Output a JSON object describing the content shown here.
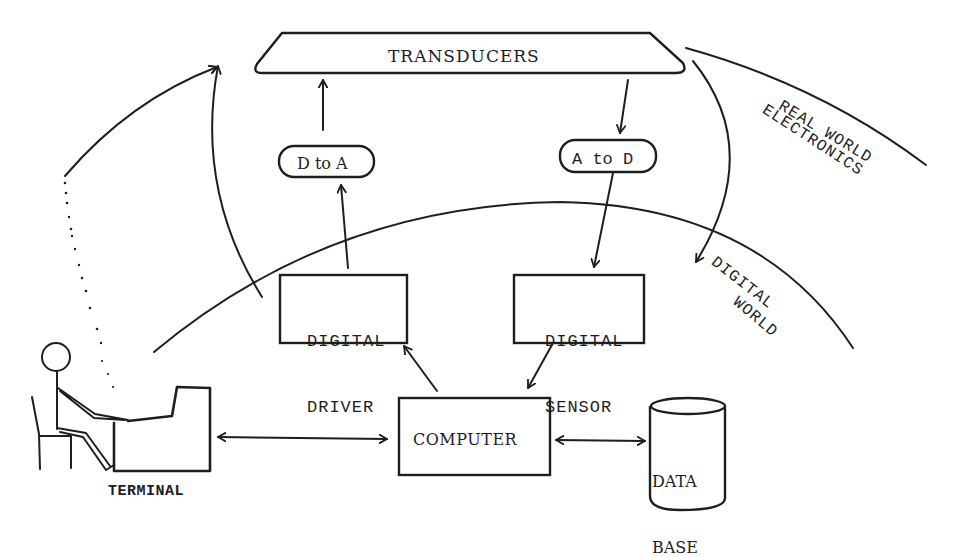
{
  "diagram": {
    "type": "system-block-diagram",
    "style": "hand-drawn typewriter illustration",
    "ink_color": "#1e1e1e",
    "background_color": "#ffffff",
    "regions": {
      "real_world_electronics": {
        "line1": "REAL WORLD",
        "line2": "ELECTRONICS"
      },
      "digital_world": {
        "line1": "DIGITAL",
        "line2": "WORLD"
      }
    },
    "nodes": {
      "transducers": {
        "label": "TRANSDUCERS",
        "shape": "rounded-trapezoid"
      },
      "d_to_a": {
        "label": "D to A",
        "shape": "pill"
      },
      "a_to_d": {
        "label": "A to D",
        "shape": "pill"
      },
      "digital_driver": {
        "line1": "DIGITAL",
        "line2": "DRIVER",
        "shape": "rectangle"
      },
      "digital_sensor": {
        "line1": "DIGITAL",
        "line2": "SENSOR",
        "shape": "rectangle"
      },
      "computer": {
        "label": "COMPUTER",
        "shape": "rectangle"
      },
      "database": {
        "line1": "DATA",
        "line2": "BASE",
        "shape": "cylinder"
      },
      "terminal": {
        "label": "TERMINAL",
        "shape": "operator-at-terminal"
      }
    },
    "edges": [
      {
        "from": "computer",
        "to": "digital_driver",
        "direction": "forward"
      },
      {
        "from": "digital_driver",
        "to": "d_to_a",
        "direction": "forward"
      },
      {
        "from": "d_to_a",
        "to": "transducers",
        "direction": "forward"
      },
      {
        "from": "transducers",
        "to": "a_to_d",
        "direction": "forward"
      },
      {
        "from": "a_to_d",
        "to": "digital_sensor",
        "direction": "forward"
      },
      {
        "from": "digital_sensor",
        "to": "computer",
        "direction": "forward"
      },
      {
        "from": "terminal",
        "to": "computer",
        "direction": "bidirectional"
      },
      {
        "from": "computer",
        "to": "database",
        "direction": "bidirectional"
      },
      {
        "from": "digital_world",
        "to": "transducers",
        "direction": "forward",
        "style": "curved"
      },
      {
        "from": "terminal",
        "to": "transducers",
        "direction": "forward",
        "style": "dotted-then-curved"
      },
      {
        "from": "transducers",
        "to": "digital_world",
        "direction": "forward",
        "style": "curved"
      }
    ]
  }
}
